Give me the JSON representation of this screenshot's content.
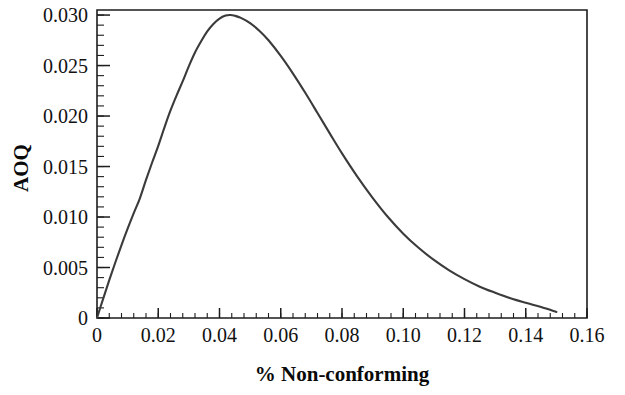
{
  "chart_data": {
    "type": "line",
    "title": "",
    "subtitle": "",
    "xlabel": "% Non-conforming",
    "ylabel": "AOQ",
    "xlim": [
      0,
      0.16
    ],
    "ylim": [
      0,
      0.0305
    ],
    "grid": false,
    "legend": null,
    "legend_position": "none",
    "x_major_ticks": [
      0,
      0.02,
      0.04,
      0.06,
      0.08,
      0.1,
      0.12,
      0.14,
      0.16
    ],
    "x_tick_labels": [
      "0",
      "0.02",
      "0.04",
      "0.06",
      "0.08",
      "0.10",
      "0.12",
      "0.14",
      "0.16"
    ],
    "x_minor_tick_step": 0.004,
    "y_major_ticks": [
      0,
      0.005,
      0.01,
      0.015,
      0.02,
      0.025,
      0.03
    ],
    "y_tick_labels": [
      "0",
      "0.005",
      "0.010",
      "0.015",
      "0.020",
      "0.025",
      "0.030"
    ],
    "y_minor_tick_step": 0.001,
    "series": [
      {
        "name": "AOQ",
        "color": "#3b3b3b",
        "line_width": 2.1,
        "x": [
          0.0,
          0.002,
          0.004,
          0.006,
          0.008,
          0.01,
          0.012,
          0.014,
          0.016,
          0.018,
          0.02,
          0.022,
          0.024,
          0.026,
          0.028,
          0.03,
          0.032,
          0.034,
          0.036,
          0.038,
          0.04,
          0.042,
          0.0435,
          0.045,
          0.047,
          0.05,
          0.053,
          0.056,
          0.06,
          0.064,
          0.068,
          0.072,
          0.076,
          0.08,
          0.085,
          0.09,
          0.095,
          0.1,
          0.105,
          0.11,
          0.115,
          0.12,
          0.125,
          0.13,
          0.135,
          0.14,
          0.145,
          0.15
        ],
        "y": [
          0.0,
          0.0019,
          0.00375,
          0.00552,
          0.00722,
          0.00884,
          0.01038,
          0.01185,
          0.01367,
          0.0154,
          0.01705,
          0.01885,
          0.02055,
          0.02205,
          0.02345,
          0.02495,
          0.0263,
          0.0274,
          0.02838,
          0.02912,
          0.02965,
          0.02995,
          0.03,
          0.02993,
          0.02972,
          0.0292,
          0.02845,
          0.0275,
          0.02595,
          0.0242,
          0.0223,
          0.0203,
          0.01828,
          0.0163,
          0.014,
          0.0119,
          0.01,
          0.00835,
          0.00695,
          0.00575,
          0.00472,
          0.00385,
          0.0031,
          0.0025,
          0.00195,
          0.0015,
          0.00108,
          0.0006
        ]
      }
    ],
    "annotations": [
      {
        "label": "peak",
        "x": 0.0435,
        "y": 0.03,
        "text": ""
      }
    ],
    "peak_value": 0.03,
    "peak_x": 0.0435,
    "curve_end_x": 0.15
  },
  "axes": {
    "y_title": "AOQ",
    "x_title": "% Non-conforming"
  },
  "colors": {
    "curve": "#3b3b3b",
    "frame": "#1d1d1d",
    "text": "#111111",
    "background": "#ffffff"
  }
}
